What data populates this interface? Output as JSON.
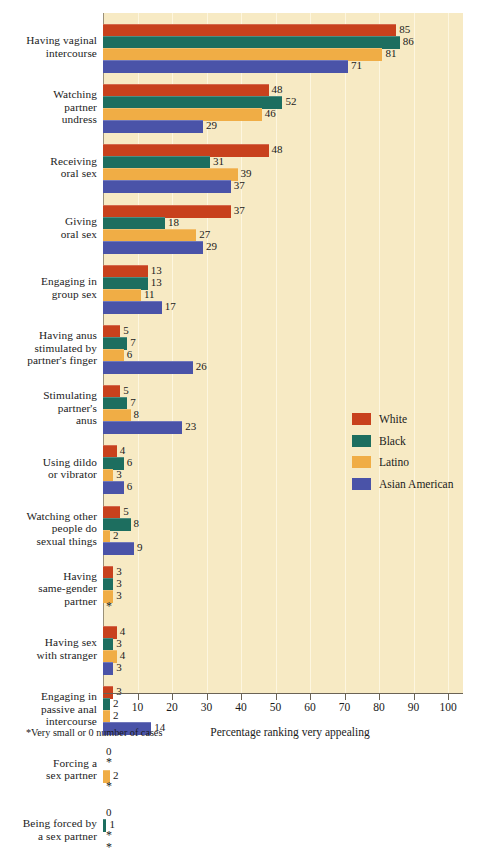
{
  "chart_data": {
    "type": "bar",
    "orientation": "horizontal",
    "title": "",
    "xlabel": "Percentage ranking very appealing",
    "ylabel": "",
    "xlim": [
      0,
      100
    ],
    "xticks": [
      10,
      20,
      30,
      40,
      50,
      60,
      70,
      80,
      90,
      100
    ],
    "grid": true,
    "legend_position": "middle-right",
    "footnote": "*Very small or 0 number of cases",
    "star_symbol": "*",
    "categories": [
      "Having vaginal intercourse",
      "Watching partner undress",
      "Receiving oral sex",
      "Giving oral sex",
      "Engaging in group sex",
      "Having anus stimulated by partner's finger",
      "Stimulating partner's anus",
      "Using dildo or vibrator",
      "Watching other people do sexual things",
      "Having same-gender partner",
      "Having sex with stranger",
      "Engaging in passive anal intercourse",
      "Forcing a sex partner",
      "Being forced by a sex partner"
    ],
    "category_lines": [
      [
        "Having vaginal",
        "intercourse"
      ],
      [
        "Watching",
        "partner",
        "undress"
      ],
      [
        "Receiving",
        "oral sex"
      ],
      [
        "Giving",
        "oral sex"
      ],
      [
        "Engaging in",
        "group sex"
      ],
      [
        "Having anus",
        "stimulated by",
        "partner's finger"
      ],
      [
        "Stimulating",
        "partner's",
        "anus"
      ],
      [
        "Using dildo",
        "or vibrator"
      ],
      [
        "Watching other",
        "people do",
        "sexual things"
      ],
      [
        "Having",
        "same-gender",
        "partner"
      ],
      [
        "Having sex",
        "with stranger"
      ],
      [
        "Engaging in",
        "passive anal",
        "intercourse"
      ],
      [
        "Forcing a",
        "sex partner"
      ],
      [
        "Being forced by",
        "a sex partner"
      ]
    ],
    "series": [
      {
        "name": "White",
        "color": "#c8411d",
        "values": [
          85,
          48,
          48,
          37,
          13,
          5,
          5,
          4,
          5,
          3,
          4,
          3,
          0,
          0
        ],
        "labels": [
          "85",
          "48",
          "48",
          "37",
          "13",
          "5",
          "5",
          "4",
          "5",
          "3",
          "4",
          "3",
          "0",
          "0"
        ]
      },
      {
        "name": "Black",
        "color": "#1d6e5f",
        "values": [
          86,
          52,
          31,
          18,
          13,
          7,
          7,
          6,
          8,
          3,
          3,
          2,
          0,
          1
        ],
        "labels": [
          "86",
          "52",
          "31",
          "18",
          "13",
          "7",
          "7",
          "6",
          "8",
          "3",
          "3",
          "2",
          "*",
          "1"
        ]
      },
      {
        "name": "Latino",
        "color": "#f0ad45",
        "values": [
          81,
          46,
          39,
          27,
          11,
          6,
          8,
          3,
          2,
          3,
          4,
          2,
          2,
          0
        ],
        "labels": [
          "81",
          "46",
          "39",
          "27",
          "11",
          "6",
          "8",
          "3",
          "2",
          "3",
          "4",
          "2",
          "2",
          "*"
        ]
      },
      {
        "name": "Asian American",
        "color": "#4a53a8",
        "values": [
          71,
          29,
          37,
          29,
          17,
          26,
          23,
          6,
          9,
          0,
          3,
          14,
          0,
          0
        ],
        "labels": [
          "71",
          "29",
          "37",
          "29",
          "17",
          "26",
          "23",
          "6",
          "9",
          "*",
          "3",
          "14",
          "*",
          "*"
        ]
      }
    ]
  },
  "legend": {
    "items": [
      {
        "label": "White",
        "color": "#c8411d"
      },
      {
        "label": "Black",
        "color": "#1d6e5f"
      },
      {
        "label": "Latino",
        "color": "#f0ad45"
      },
      {
        "label": "Asian American",
        "color": "#4a53a8"
      }
    ]
  },
  "axis": {
    "title": "Percentage ranking very appealing",
    "ticks": [
      "10",
      "20",
      "30",
      "40",
      "50",
      "60",
      "70",
      "80",
      "90",
      "100"
    ]
  },
  "footnote": {
    "text": "*Very small or 0 number of cases"
  },
  "colors": {
    "plot_background": "#f7eac4",
    "page_background": "#ffffff",
    "gridline": "#fdf6e0",
    "axis": "#6b6355",
    "text": "#1a1a1a"
  }
}
